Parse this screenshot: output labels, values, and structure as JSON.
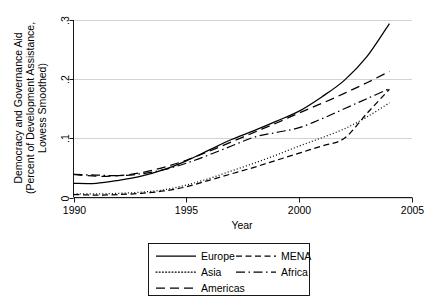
{
  "chart_data": {
    "type": "line",
    "title": "",
    "xlabel": "Year",
    "ylabel": "Democracy and Governance Aid (Percent of Development Assistance, Lowess Smoothed)",
    "ylabel_line1": "Democracy and Governance Aid",
    "ylabel_line2": "(Percent of Development Assistance,",
    "ylabel_line3": "Lowess Smoothed)",
    "xlim": [
      1990,
      2005
    ],
    "ylim": [
      0,
      0.3
    ],
    "xticks": [
      1990,
      1995,
      2000,
      2005
    ],
    "xtick_labels": [
      "1990",
      "1995",
      "2000",
      "2005"
    ],
    "yticks": [
      0,
      0.1,
      0.2,
      0.3
    ],
    "ytick_labels": [
      "0",
      ".1",
      ".2",
      ".3"
    ],
    "grid": "horizontal",
    "legend_position": "bottom-outside",
    "x": [
      1990,
      1991,
      1992,
      1993,
      1994,
      1995,
      1996,
      1997,
      1998,
      1999,
      2000,
      2001,
      2002,
      2003,
      2004
    ],
    "series": [
      {
        "name": "Europe",
        "style": "solid",
        "dash": "none",
        "values": [
          0.024,
          0.024,
          0.029,
          0.036,
          0.047,
          0.062,
          0.08,
          0.098,
          0.113,
          0.129,
          0.146,
          0.17,
          0.198,
          0.238,
          0.294
        ]
      },
      {
        "name": "Asia",
        "style": "dotted",
        "dash": "1,2.2",
        "values": [
          0.006,
          0.006,
          0.007,
          0.009,
          0.013,
          0.021,
          0.032,
          0.045,
          0.058,
          0.072,
          0.087,
          0.101,
          0.116,
          0.136,
          0.16
        ]
      },
      {
        "name": "Americas",
        "style": "long-dash",
        "dash": "9,5",
        "values": [
          0.039,
          0.036,
          0.037,
          0.042,
          0.051,
          0.063,
          0.078,
          0.094,
          0.11,
          0.126,
          0.143,
          0.159,
          0.176,
          0.194,
          0.213
        ]
      },
      {
        "name": "MENA",
        "style": "dashed",
        "dash": "6,3.5",
        "values": [
          0.005,
          0.004,
          0.005,
          0.007,
          0.011,
          0.018,
          0.029,
          0.04,
          0.051,
          0.063,
          0.075,
          0.087,
          0.1,
          0.142,
          0.183
        ]
      },
      {
        "name": "Africa",
        "style": "dash-dot",
        "dash": "9,3.5,1.5,3.5",
        "values": [
          0.039,
          0.038,
          0.037,
          0.04,
          0.047,
          0.058,
          0.072,
          0.087,
          0.102,
          0.11,
          0.118,
          0.133,
          0.15,
          0.167,
          0.184
        ]
      }
    ],
    "legend": {
      "column1": [
        {
          "label": "Europe",
          "style": "solid"
        },
        {
          "label": "Asia",
          "style": "dotted"
        },
        {
          "label": "Americas",
          "style": "long-dash"
        }
      ],
      "column2": [
        {
          "label": "MENA",
          "style": "dashed"
        },
        {
          "label": "Africa",
          "style": "dash-dot"
        }
      ]
    },
    "colors": {
      "series": "#000000",
      "grid": "#c8c8c8",
      "axis": "#000000",
      "background": "#ffffff"
    }
  }
}
